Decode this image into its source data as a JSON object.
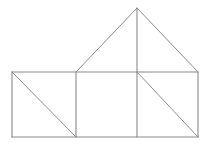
{
  "figure": {
    "title": "House-shaped geometric line figure",
    "canvas": {
      "width": 209,
      "height": 148,
      "background_color": "#ffffff"
    },
    "style": {
      "stroke_color": "#8a8a8a",
      "diagonal_stroke_color": "#8e8e8e",
      "roof_stroke_color": "#8b8b8b",
      "stroke_width": 1.1,
      "fill": "none"
    },
    "points": {
      "base_top_left": {
        "x": 12,
        "y": 72
      },
      "base_bottom_left": {
        "x": 12,
        "y": 137
      },
      "base_top_right": {
        "x": 198,
        "y": 72
      },
      "base_bottom_right": {
        "x": 198,
        "y": 137
      },
      "divider_one_top": {
        "x": 76,
        "y": 72
      },
      "divider_one_bottom": {
        "x": 76,
        "y": 137
      },
      "divider_two_top": {
        "x": 137,
        "y": 72
      },
      "divider_two_bottom": {
        "x": 137,
        "y": 137
      },
      "roof_apex": {
        "x": 137,
        "y": 8
      }
    },
    "segments": [
      {
        "name": "base-top-edge",
        "kind": "horizontal",
        "x1": 12,
        "y1": 72,
        "x2": 198,
        "y2": 72
      },
      {
        "name": "base-bottom-edge",
        "kind": "horizontal",
        "x1": 12,
        "y1": 137,
        "x2": 198,
        "y2": 137
      },
      {
        "name": "base-left-edge",
        "kind": "vertical",
        "x1": 12,
        "y1": 72,
        "x2": 12,
        "y2": 137
      },
      {
        "name": "base-right-edge",
        "kind": "vertical",
        "x1": 198,
        "y1": 72,
        "x2": 198,
        "y2": 137
      },
      {
        "name": "divider-one",
        "kind": "vertical",
        "x1": 76,
        "y1": 72,
        "x2": 76,
        "y2": 137
      },
      {
        "name": "divider-two",
        "kind": "vertical",
        "x1": 137,
        "y1": 72,
        "x2": 137,
        "y2": 137
      },
      {
        "name": "left-cell-diagonal",
        "kind": "diagonal",
        "x1": 12,
        "y1": 72,
        "x2": 76,
        "y2": 137
      },
      {
        "name": "right-cell-diagonal",
        "kind": "diagonal",
        "x1": 137,
        "y1": 72,
        "x2": 198,
        "y2": 137
      },
      {
        "name": "roof-left-slope",
        "kind": "diagonal",
        "x1": 76,
        "y1": 72,
        "x2": 137,
        "y2": 8
      },
      {
        "name": "roof-right-slope",
        "kind": "diagonal",
        "x1": 137,
        "y1": 8,
        "x2": 198,
        "y2": 72
      },
      {
        "name": "roof-center-axis",
        "kind": "vertical",
        "x1": 137,
        "y1": 8,
        "x2": 137,
        "y2": 72
      }
    ],
    "cells": [
      {
        "name": "left-rectangle",
        "x": 12,
        "y": 72,
        "width": 64,
        "height": 65,
        "has_diagonal": true
      },
      {
        "name": "middle-rectangle",
        "x": 76,
        "y": 72,
        "width": 61,
        "height": 65,
        "has_diagonal": false
      },
      {
        "name": "right-rectangle",
        "x": 137,
        "y": 72,
        "width": 61,
        "height": 65,
        "has_diagonal": true
      }
    ],
    "triangles": [
      {
        "name": "roof-left-triangle",
        "vertices": [
          [
            76,
            72
          ],
          [
            137,
            8
          ],
          [
            137,
            72
          ]
        ]
      },
      {
        "name": "roof-right-triangle",
        "vertices": [
          [
            137,
            8
          ],
          [
            198,
            72
          ],
          [
            137,
            72
          ]
        ]
      }
    ],
    "labels": []
  }
}
